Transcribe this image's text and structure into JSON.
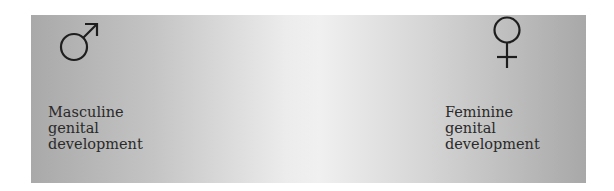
{
  "diagram": {
    "left": {
      "icon": "male-symbol-icon",
      "label_lines": [
        "Masculine",
        "genital",
        "development"
      ]
    },
    "right": {
      "icon": "female-symbol-icon",
      "label_lines": [
        "Feminine",
        "genital",
        "development"
      ]
    },
    "gradient": {
      "edge_color": "#a9a9a9",
      "center_color": "#f0f0f0"
    }
  }
}
